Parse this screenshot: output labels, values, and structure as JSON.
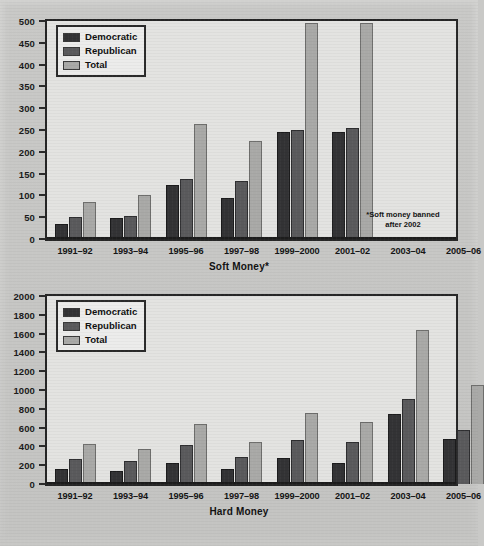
{
  "series_names": [
    "Democratic",
    "Republican",
    "Total"
  ],
  "colors": {
    "democratic": "#333335",
    "republican": "#5a5a5c",
    "total": "#a9a9a7",
    "frame": "#262626",
    "plot_background": "#e3e3e1",
    "page_background": "#cfcfcd"
  },
  "soft": {
    "axis_title": "Soft Money*",
    "footnote": "*Soft money banned\nafter 2002",
    "legend": [
      "Democratic",
      "Republican",
      "Total"
    ],
    "ytick_labels": [
      "500",
      "450",
      "400",
      "350",
      "300",
      "250",
      "200",
      "150",
      "100",
      "50",
      "0"
    ],
    "xtick_labels": [
      "1991–92",
      "1993–94",
      "1995–96",
      "1997–98",
      "1999–2000",
      "2001–02",
      "2003–04",
      "2005–06"
    ]
  },
  "hard": {
    "axis_title": "Hard Money",
    "legend": [
      "Democratic",
      "Republican",
      "Total"
    ],
    "ytick_labels": [
      "2000",
      "1800",
      "1600",
      "1400",
      "1200",
      "1000",
      "800",
      "600",
      "400",
      "200",
      "0"
    ],
    "xtick_labels": [
      "1991–92",
      "1993–94",
      "1995–96",
      "1997–98",
      "1999–2000",
      "2001–02",
      "2003–04",
      "2005–06"
    ]
  },
  "chart_data": [
    {
      "type": "bar",
      "title": "Soft Money*",
      "xlabel": "Soft Money*",
      "ylabel": "",
      "ylim": [
        0,
        500
      ],
      "ytick_step": 50,
      "grid": false,
      "legend_position": "top-left",
      "annotations": [
        "*Soft money banned after 2002"
      ],
      "categories": [
        "1991–92",
        "1993–94",
        "1995–96",
        "1997–98",
        "1999–2000",
        "2001–02",
        "2003–04",
        "2005–06"
      ],
      "series": [
        {
          "name": "Democratic",
          "values": [
            35,
            49,
            124,
            93,
            245,
            246,
            0,
            0
          ]
        },
        {
          "name": "Republican",
          "values": [
            50,
            52,
            138,
            132,
            250,
            254,
            0,
            0
          ]
        },
        {
          "name": "Total",
          "values": [
            85,
            101,
            263,
            224,
            495,
            496,
            0,
            0
          ]
        }
      ]
    },
    {
      "type": "bar",
      "title": "Hard Money",
      "xlabel": "Hard Money",
      "ylabel": "",
      "ylim": [
        0,
        2000
      ],
      "ytick_step": 200,
      "grid": false,
      "legend_position": "top-left",
      "categories": [
        "1991–92",
        "1993–94",
        "1995–96",
        "1997–98",
        "1999–2000",
        "2001–02",
        "2003–04",
        "2005–06"
      ],
      "series": [
        {
          "name": "Democratic",
          "values": [
            155,
            135,
            225,
            165,
            280,
            220,
            745,
            480
          ]
        },
        {
          "name": "Republican",
          "values": [
            265,
            240,
            415,
            290,
            465,
            450,
            900,
            575
          ]
        },
        {
          "name": "Total",
          "values": [
            425,
            375,
            640,
            450,
            760,
            660,
            1635,
            1050
          ]
        }
      ]
    }
  ]
}
